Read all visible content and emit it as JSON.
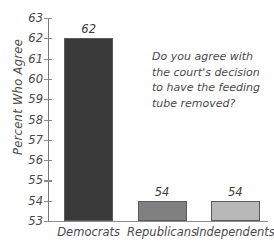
{
  "chart_data": {
    "type": "bar",
    "title": "",
    "subtitle": "",
    "xlabel": "",
    "ylabel": "Percent Who Agree",
    "categories": [
      "Democrats",
      "Republicans",
      "Independents"
    ],
    "values": [
      62,
      54,
      54
    ],
    "value_labels": [
      "62",
      "54",
      "54"
    ],
    "bar_colors": [
      "#3a3a3a",
      "#808080",
      "#b8b8b8"
    ],
    "bar_edge_color": "#5b5b5b",
    "ylim": [
      53,
      63
    ],
    "ytick_values": [
      53,
      54,
      55,
      56,
      57,
      58,
      59,
      60,
      61,
      62,
      63
    ],
    "ytick_labels": [
      "53",
      "54",
      "55",
      "56",
      "57",
      "58",
      "59",
      "60",
      "61",
      "62",
      "63"
    ],
    "grid": false,
    "legend": "none",
    "style": "hand-drawn",
    "annotations": [
      {
        "name": "survey-question",
        "lines": [
          "Do you agree with",
          "the court's decision",
          "to have the feeding",
          "tube removed?"
        ]
      }
    ],
    "axis_color": "#8a8a8a",
    "text_color": "#4a4a4a",
    "background_color": "#ffffff"
  }
}
